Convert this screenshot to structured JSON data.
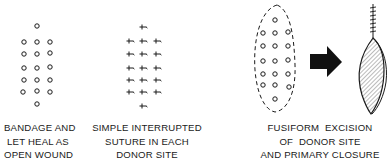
{
  "panels": [
    {
      "id": "open-wound",
      "caption": [
        "BANDAGE AND",
        "LET HEAL AS",
        "OPEN WOUND"
      ]
    },
    {
      "id": "simple-interrupted-suture",
      "caption": [
        "SIMPLE INTERRUPTED",
        "SUTURE IN EACH",
        "DONOR SITE"
      ]
    },
    {
      "id": "fusiform-excision",
      "caption": [
        "FUSIFORM  EXCISION",
        "OF  DONOR SITE",
        "AND PRIMARY CLOSURE"
      ]
    }
  ],
  "colors": {
    "ink": "#1a1a1a",
    "background": "#ffffff",
    "shading": "#bdbdbd"
  },
  "icons": {
    "donor_site": "small-circle",
    "suture": "suture-cross",
    "arrow": "right-arrow"
  }
}
